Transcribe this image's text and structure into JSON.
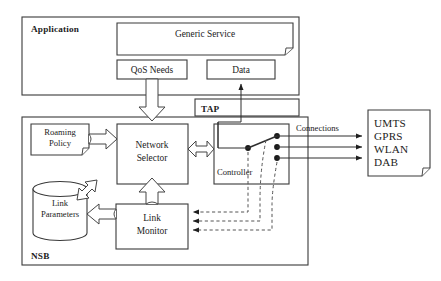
{
  "diagram": {
    "layers": {
      "application": {
        "label": "Application",
        "generic_service": {
          "label": "Generic Service",
          "shape": "document"
        },
        "qos_needs": {
          "label": "QoS Needs",
          "shape": "rect"
        },
        "data": {
          "label": "Data",
          "shape": "rect"
        }
      },
      "tap": {
        "label": "TAP",
        "shape": "rect"
      },
      "nsb": {
        "label": "NSB",
        "roaming_policy": {
          "label_line1": "Roaming",
          "label_line2": "Policy",
          "shape": "document"
        },
        "network_selector": {
          "label_line1": "Network",
          "label_line2": "Selector",
          "shape": "rect"
        },
        "link_parameters": {
          "label_line1": "Link",
          "label_line2": "Parameters",
          "shape": "cylinder"
        },
        "link_monitor": {
          "label_line1": "Link",
          "label_line2": "Monitor",
          "shape": "rect"
        },
        "controller": {
          "label": "Controller",
          "shape": "rect"
        }
      }
    },
    "annotations": {
      "connections_label": "Connections"
    },
    "networks": {
      "shape": "document",
      "items": [
        "UMTS",
        "GPRS",
        "WLAN",
        "DAB"
      ]
    },
    "colors": {
      "background": "#ffffff",
      "stroke": "#3a3a3a",
      "text": "#1c1c1c",
      "dashed_stroke": "#555555",
      "dot_fill": "#1a1a1a"
    }
  }
}
